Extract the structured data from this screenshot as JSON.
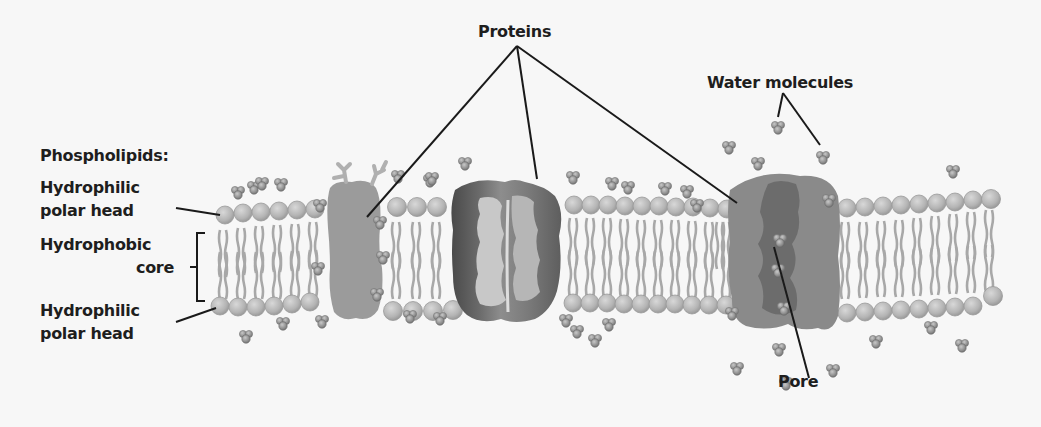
{
  "diagram": {
    "title_labels": {
      "proteins": "Proteins",
      "water_molecules": "Water molecules",
      "phospholipids": "Phospholipids:",
      "pore": "Pore"
    },
    "left_labels": {
      "top_head_line1": "Hydrophilic",
      "top_head_line2": "polar head",
      "core_line1": "Hydrophobic",
      "core_line2": "core",
      "bottom_head_line1": "Hydrophilic",
      "bottom_head_line2": "polar head"
    },
    "components": [
      {
        "name": "Glycoprotein (left)",
        "type": "integral protein"
      },
      {
        "name": "Channel protein (middle)",
        "type": "integral protein"
      },
      {
        "name": "Aquaporin (right)",
        "type": "water channel protein with pore"
      }
    ],
    "colors": {
      "background": "#f7f7f7",
      "head": "#b8b8b8",
      "tail": "#a9a9a9",
      "protein_left": "#9a9a9a",
      "protein_mid_dark": "#5a5a5a",
      "protein_mid_light": "#c6c6c6",
      "protein_right": "#8c8c8c",
      "protein_right_pore": "#6e6e6e",
      "water": "#8a8a8a",
      "line": "#1a1a1a"
    }
  }
}
